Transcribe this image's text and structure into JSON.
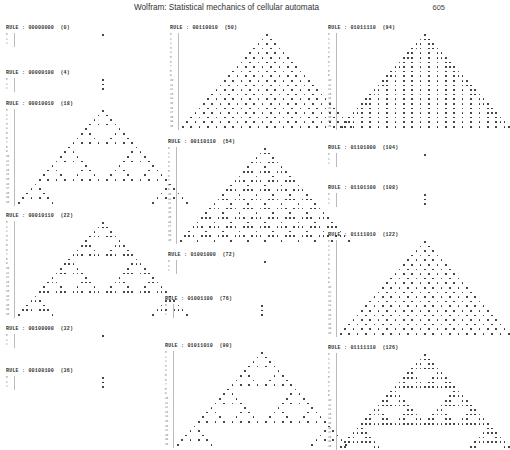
{
  "header": {
    "title": "Wolfram:  Statistical mechanics of cellular automata",
    "page_number": "605"
  },
  "panels": [
    {
      "label": "RULE : 00000000  (0)",
      "rule": 0,
      "steps": 2,
      "x": 6,
      "y": 25
    },
    {
      "label": "RULE : 00000100  (4)",
      "rule": 4,
      "steps": 2,
      "x": 6,
      "y": 70
    },
    {
      "label": "RULE : 00010010  (18)",
      "rule": 18,
      "steps": 20,
      "x": 6,
      "y": 101
    },
    {
      "label": "RULE : 00010110  (22)",
      "rule": 22,
      "steps": 20,
      "x": 6,
      "y": 213
    },
    {
      "label": "RULE : 00100000  (32)",
      "rule": 32,
      "steps": 2,
      "x": 6,
      "y": 326
    },
    {
      "label": "RULE : 00100100  (36)",
      "rule": 36,
      "steps": 2,
      "x": 6,
      "y": 368
    },
    {
      "label": "RULE : 00110010  (50)",
      "rule": 50,
      "steps": 20,
      "x": 170,
      "y": 25
    },
    {
      "label": "RULE : 00110110  (54)",
      "rule": 54,
      "steps": 20,
      "x": 168,
      "y": 139
    },
    {
      "label": "RULE : 01001000  (72)",
      "rule": 72,
      "steps": 2,
      "x": 168,
      "y": 252
    },
    {
      "label": "RULE : 01001100  (76)",
      "rule": 76,
      "steps": 2,
      "x": 165,
      "y": 296
    },
    {
      "label": "RULE : 01011010  (90)",
      "rule": 90,
      "steps": 20,
      "x": 165,
      "y": 343
    },
    {
      "label": "RULE : 01011110  (94)",
      "rule": 94,
      "steps": 20,
      "x": 328,
      "y": 25
    },
    {
      "label": "RULE : 01101000  (104)",
      "rule": 104,
      "steps": 2,
      "x": 328,
      "y": 145
    },
    {
      "label": "RULE : 01101100  (108)",
      "rule": 108,
      "steps": 2,
      "x": 328,
      "y": 185
    },
    {
      "label": "RULE : 01111010  (122)",
      "rule": 122,
      "steps": 20,
      "x": 328,
      "y": 232
    },
    {
      "label": "RULE : 01111110  (126)",
      "rule": 126,
      "steps": 20,
      "x": 328,
      "y": 345
    }
  ]
}
